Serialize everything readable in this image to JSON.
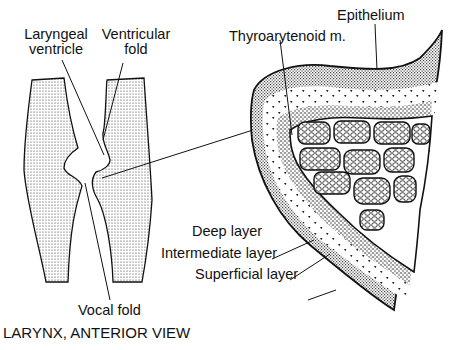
{
  "diagram": {
    "title": "LARYNX, ANTERIOR VIEW",
    "left_panel": {
      "labels": {
        "laryngeal_ventricle_line1": "Laryngeal",
        "laryngeal_ventricle_line2": "ventricle",
        "ventricular_fold_line1": "Ventricular",
        "ventricular_fold_line2": "fold",
        "vocal_fold": "Vocal fold"
      }
    },
    "right_panel": {
      "labels": {
        "epithelium": "Epithelium",
        "thyroarytenoid": "Thyroarytenoid m.",
        "deep_layer": "Deep layer",
        "intermediate_layer": "Intermediate layer",
        "superficial_layer": "Superficial layer"
      }
    },
    "colors": {
      "ink": "#111111",
      "background": "#ffffff"
    }
  }
}
